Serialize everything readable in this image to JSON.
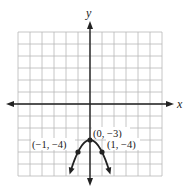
{
  "graph": {
    "x_axis_label": "x",
    "y_axis_label": "y",
    "grid": {
      "x_min": -6,
      "x_max": 6,
      "y_min": -6,
      "y_max": 6,
      "step": 1
    },
    "function": "y = -x^2 - 3",
    "curve_x_range": [
      -1.6,
      1.6
    ],
    "points": [
      {
        "x": 0,
        "y": -3,
        "label": "(0, −3)"
      },
      {
        "x": -1,
        "y": -4,
        "label": "(−1, −4)"
      },
      {
        "x": 1,
        "y": -4,
        "label": "(1, −4)"
      }
    ],
    "colors": {
      "grid": "#b8b8b8",
      "axis": "#222222",
      "curve": "#222222"
    }
  }
}
